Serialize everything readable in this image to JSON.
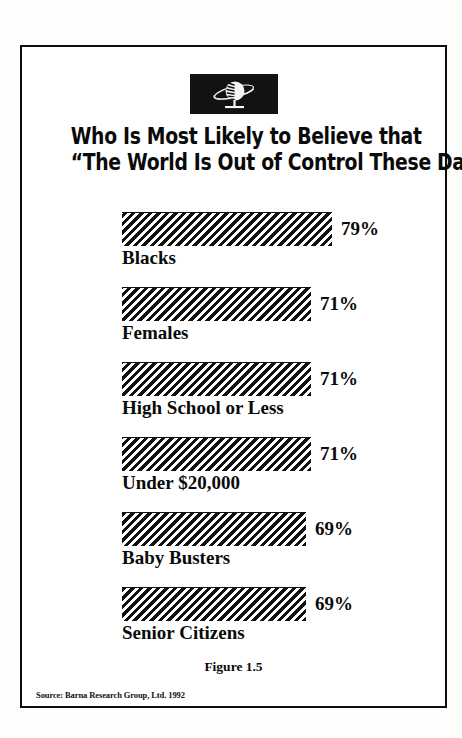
{
  "figure": {
    "logo_icon": "globe-on-stand-icon",
    "title_line1": "Who Is Most Likely to Believe that",
    "title_line2": "“The World Is Out of Control These Days”?",
    "caption": "Figure 1.5",
    "source": "Source: Barna Research Group, Ltd. 1992",
    "border_color": "#0d0d0d",
    "ink_color": "#0a0a0a",
    "hatch_color": "#111111",
    "page_background": "#ffffff"
  },
  "chart_data": {
    "type": "bar",
    "orientation": "horizontal",
    "title": "Who Is Most Likely to Believe that “The World Is Out of Control These Days”?",
    "xlabel": "",
    "ylabel": "",
    "xlim": [
      0,
      100
    ],
    "grid": false,
    "legend": "none",
    "value_suffix": "%",
    "categories": [
      "Blacks",
      "Females",
      "High School or Less",
      "Under $20,000",
      "Baby Busters",
      "Senior Citizens"
    ],
    "values": [
      79,
      71,
      71,
      71,
      69,
      69
    ],
    "labels": [
      "79%",
      "71%",
      "71%",
      "71%",
      "69%",
      "69%"
    ],
    "annotations": [
      "Figure 1.5",
      "Source: Barna Research Group, Ltd. 1992"
    ]
  },
  "bars": [
    {
      "category": "Blacks",
      "value": 79,
      "label": "79%",
      "width_px": 210
    },
    {
      "category": "Females",
      "value": 71,
      "label": "71%",
      "width_px": 189
    },
    {
      "category": "High School or Less",
      "value": 71,
      "label": "71%",
      "width_px": 189
    },
    {
      "category": "Under $20,000",
      "value": 71,
      "label": "71%",
      "width_px": 189
    },
    {
      "category": "Baby Busters",
      "value": 69,
      "label": "69%",
      "width_px": 184
    },
    {
      "category": "Senior Citizens",
      "value": 69,
      "label": "69%",
      "width_px": 184
    }
  ]
}
